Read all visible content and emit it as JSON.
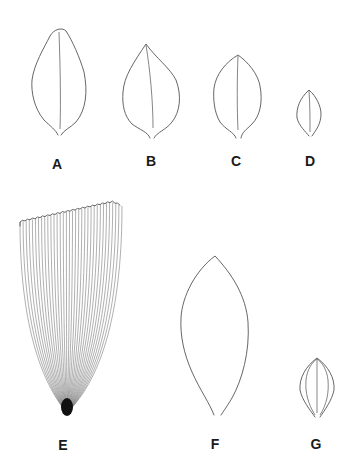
{
  "figure": {
    "panels": [
      {
        "id": "A",
        "label": "A",
        "shape": "ovate leaf, rounded apex, single midrib, notched base",
        "label_pos": [
          57,
          157
        ]
      },
      {
        "id": "B",
        "label": "B",
        "shape": "ovate leaf, acute apex, single midrib, notched base",
        "label_pos": [
          151,
          154
        ]
      },
      {
        "id": "C",
        "label": "C",
        "shape": "elliptic leaf, acute apex, single midrib, notched base",
        "label_pos": [
          236,
          154
        ]
      },
      {
        "id": "D",
        "label": "D",
        "shape": "small elliptic leaf, single midrib",
        "label_pos": [
          310,
          154
        ]
      },
      {
        "id": "E",
        "label": "E",
        "shape": "truncate petal with many parallel veins converging at base",
        "label_pos": [
          63,
          438
        ]
      },
      {
        "id": "F",
        "label": "F",
        "shape": "lanceolate leaf outline, acute apex, open base",
        "label_pos": [
          215,
          437
        ]
      },
      {
        "id": "G",
        "label": "G",
        "shape": "small elliptic leaf with three to five arcuate veins",
        "label_pos": [
          316,
          437
        ]
      }
    ],
    "colors": {
      "line": "#555555",
      "label": "#1a1a1a",
      "background": "#ffffff"
    }
  }
}
